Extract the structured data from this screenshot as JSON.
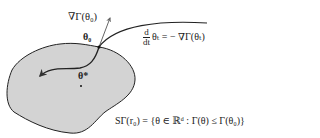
{
  "diagram": {
    "labels": {
      "gradient_at_theta0": "∇Γ(θ₀)",
      "theta0": "θ₀",
      "ode_numerator": "d",
      "ode_denominator": "dt",
      "ode_rhs": "θₜ = − ∇Γ(θₜ)",
      "theta_star": "θ*",
      "sublevel_set": "SΓ(r₀) = {θ ∈ ℝᵈ : Γ(θ) ≤ Γ(θ₀)}"
    },
    "colors": {
      "region_fill": "#d3d3d3",
      "stroke": "#222222",
      "arrow": "#555555"
    }
  }
}
